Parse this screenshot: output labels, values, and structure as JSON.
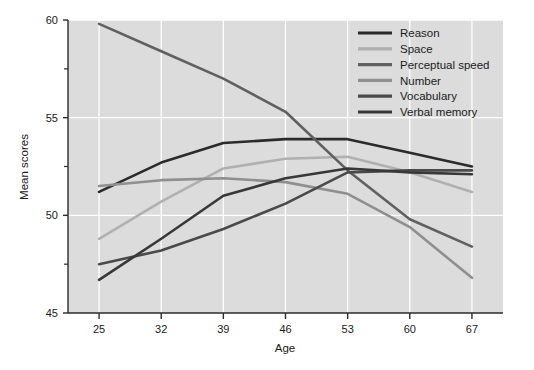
{
  "chart_data": {
    "type": "line",
    "title": "",
    "xlabel": "Age",
    "ylabel": "Mean scores",
    "x": [
      25,
      32,
      39,
      46,
      53,
      60,
      67
    ],
    "xticklabels": [
      "25",
      "32",
      "39",
      "46",
      "53",
      "60",
      "67"
    ],
    "yticklabels": [
      "45",
      "50",
      "55",
      "60"
    ],
    "yticks": [
      45,
      50,
      55,
      60
    ],
    "yminorticks": [
      47.5,
      52.5,
      57.5
    ],
    "xlim": [
      21.5,
      70.5
    ],
    "ylim": [
      45,
      60
    ],
    "grid": true,
    "grid_color": "#ffffff",
    "plot_background": "#dcdcdc",
    "legend_position": "top-right",
    "series": [
      {
        "name": "Reason",
        "color": "#2b2b2b",
        "values": [
          51.2,
          52.7,
          53.7,
          53.9,
          53.9,
          53.2,
          52.5
        ]
      },
      {
        "name": "Space",
        "color": "#b0b0b0",
        "values": [
          48.8,
          50.7,
          52.4,
          52.9,
          53.0,
          52.2,
          51.2
        ]
      },
      {
        "name": "Perceptual speed",
        "color": "#606060",
        "values": [
          59.8,
          58.4,
          57.0,
          55.3,
          52.3,
          49.8,
          48.4
        ]
      },
      {
        "name": "Number",
        "color": "#8f8f8f",
        "values": [
          51.5,
          51.8,
          51.9,
          51.7,
          51.1,
          49.4,
          46.8
        ]
      },
      {
        "name": "Vocabulary",
        "color": "#4a4a4a",
        "values": [
          47.5,
          48.2,
          49.3,
          50.6,
          52.2,
          52.3,
          52.3
        ]
      },
      {
        "name": "Verbal memory",
        "color": "#383838",
        "values": [
          46.7,
          48.8,
          51.0,
          51.9,
          52.4,
          52.2,
          52.1
        ]
      }
    ]
  }
}
